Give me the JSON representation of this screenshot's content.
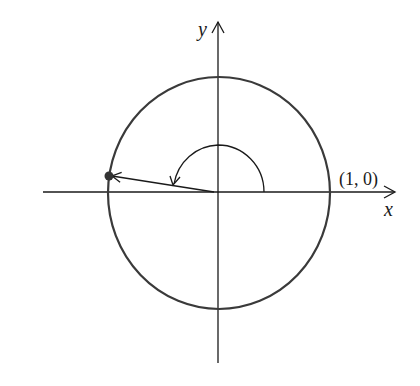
{
  "diagram": {
    "type": "unit-circle",
    "axes": {
      "x_label": "x",
      "y_label": "y"
    },
    "point_label": "(1, 0)",
    "angle": {
      "direction": "counterclockwise",
      "approx_degrees": 170
    },
    "colors": {
      "stroke": "#1a1a1a",
      "circle": "#3a3a3a",
      "background": "#ffffff"
    }
  }
}
